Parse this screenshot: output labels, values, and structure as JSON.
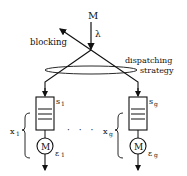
{
  "diagram": {
    "source_label": "M",
    "arrival_rate_label": "λ",
    "blocking_label": "blocking",
    "dispatch_label_line1": "dispatching",
    "dispatch_label_line2": "strategy",
    "ellipsis": "· · ·",
    "servers": [
      {
        "queue_label": "s",
        "queue_sub": "1",
        "server_label": "M",
        "rate_label": "ε",
        "rate_sub": "1",
        "count_label": "x",
        "count_sub": "1"
      },
      {
        "queue_label": "s",
        "queue_sub": "g",
        "server_label": "M",
        "rate_label": "ε",
        "rate_sub": "g",
        "count_label": "x",
        "count_sub": "g"
      }
    ]
  }
}
